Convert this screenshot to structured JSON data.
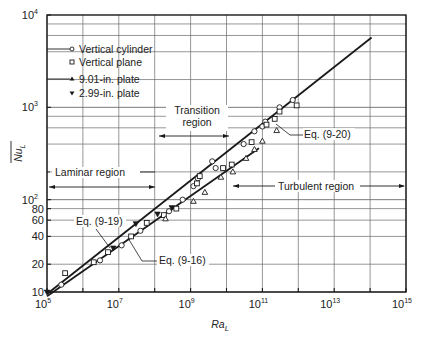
{
  "chart_data": {
    "type": "scatter",
    "title": "",
    "xlabel": "Ra_L",
    "ylabel": "Nu_L (overbar)",
    "xscale": "log",
    "yscale": "log",
    "xlim": [
      100000,
      1000000000000000.0
    ],
    "ylim": [
      10,
      10000
    ],
    "grid": true,
    "x_ticks": [
      {
        "value": 100000.0,
        "base": "10",
        "exp": "5"
      },
      {
        "value": 10000000.0,
        "base": "10",
        "exp": "7"
      },
      {
        "value": 1000000000.0,
        "base": "10",
        "exp": "9"
      },
      {
        "value": 100000000000.0,
        "base": "10",
        "exp": "11"
      },
      {
        "value": 10000000000000.0,
        "base": "10",
        "exp": "13"
      },
      {
        "value": 1000000000000000.0,
        "base": "10",
        "exp": "15"
      }
    ],
    "y_ticks": [
      {
        "value": 10,
        "label": "10",
        "exp": ""
      },
      {
        "value": 20,
        "label": "20",
        "exp": ""
      },
      {
        "value": 40,
        "label": "40",
        "exp": ""
      },
      {
        "value": 60,
        "label": "60",
        "exp": ""
      },
      {
        "value": 80,
        "label": "80",
        "exp": ""
      },
      {
        "value": 100,
        "label": "10",
        "exp": "2"
      },
      {
        "value": 1000,
        "label": "10",
        "exp": "3"
      },
      {
        "value": 10000,
        "label": "10",
        "exp": "4"
      }
    ],
    "legend": {
      "position": "upper-left",
      "entries": [
        {
          "marker": "circle",
          "label": "Vertical cylinder"
        },
        {
          "marker": "square",
          "label": "Vertical plane"
        },
        {
          "marker": "triangle-up",
          "label": "9.01-in. plate"
        },
        {
          "marker": "triangle-down",
          "label": "2.99-in. plate"
        }
      ]
    },
    "lines": [
      {
        "name": "Eq. (9-19)",
        "x": [
          100000.0,
          110000000000000.0
        ],
        "y": [
          9.5,
          5700
        ]
      },
      {
        "name": "Eq. (9-16)",
        "x": [
          100000.0,
          80000000000.0
        ],
        "y": [
          9.0,
          360
        ]
      }
    ],
    "series": [
      {
        "name": "Vertical cylinder",
        "marker": "circle",
        "points": [
          [
            250000.0,
            12
          ],
          [
            3000000.0,
            22
          ],
          [
            12000000.0,
            32
          ],
          [
            40000000.0,
            46
          ],
          [
            250000000.0,
            75
          ],
          [
            600000000.0,
            100
          ],
          [
            1600000000.0,
            170
          ],
          [
            1200000000.0,
            140
          ],
          [
            5000000000.0,
            220
          ],
          [
            4000000000.0,
            260
          ],
          [
            30000000000.0,
            400
          ],
          [
            60000000000.0,
            550
          ],
          [
            100000000000.0,
            620
          ],
          [
            120000000000.0,
            700
          ],
          [
            300000000000.0,
            1000
          ],
          [
            700000000000.0,
            1200
          ]
        ]
      },
      {
        "name": "Vertical plane",
        "marker": "square",
        "points": [
          [
            320000.0,
            16
          ],
          [
            2000000.0,
            21
          ],
          [
            5000000.0,
            27
          ],
          [
            22000000.0,
            40
          ],
          [
            60000000.0,
            56
          ],
          [
            180000000.0,
            68
          ],
          [
            400000000.0,
            80
          ],
          [
            1500000000.0,
            150
          ],
          [
            1800000000.0,
            180
          ],
          [
            8000000000.0,
            220
          ],
          [
            14000000000.0,
            240
          ],
          [
            50000000000.0,
            420
          ],
          [
            130000000000.0,
            650
          ],
          [
            220000000000.0,
            750
          ],
          [
            300000000000.0,
            900
          ],
          [
            900000000000.0,
            1050
          ]
        ]
      },
      {
        "name": "9.01-in. plate",
        "marker": "triangle-up",
        "points": [
          [
            200000000.0,
            62
          ],
          [
            1200000000.0,
            96
          ],
          [
            2500000000.0,
            120
          ],
          [
            7000000000.0,
            175
          ],
          [
            15000000000.0,
            200
          ],
          [
            35000000000.0,
            280
          ],
          [
            60000000000.0,
            350
          ],
          [
            100000000000.0,
            430
          ],
          [
            250000000000.0,
            560
          ]
        ]
      },
      {
        "name": "2.99-in. plate",
        "marker": "triangle-down",
        "points": [
          [
            100000.0,
            10
          ],
          [
            7000000.0,
            30
          ],
          [
            30000000.0,
            55
          ],
          [
            120000000.0,
            70
          ],
          [
            300000000.0,
            82
          ]
        ]
      }
    ],
    "annotations": [
      {
        "text": "Laminar region",
        "arrow_from": 100000.0,
        "arrow_to": 100000000.0,
        "y": 130
      },
      {
        "text": "Transition region",
        "arrow_from": 100000000.0,
        "arrow_to": 10000000000.0,
        "y": 470
      },
      {
        "text": "Turbulent region",
        "arrow_from": 10000000000.0,
        "arrow_to": 1000000000000000.0,
        "y": 160
      },
      {
        "text": "Eq. (9-20)"
      },
      {
        "text": "Eq. (9-19)"
      },
      {
        "text": "Eq. (9-16)"
      }
    ]
  },
  "labels": {
    "y_axis": "Nu",
    "y_axis_sub": "L",
    "x_axis": "Ra",
    "x_axis_sub": "L",
    "legend": [
      "Vertical cylinder",
      "Vertical plane",
      "9.01-in. plate",
      "2.99-in. plate"
    ],
    "laminar": "Laminar region",
    "transition_1": "Transition",
    "transition_2": "region",
    "turbulent": "Turbulent region",
    "eq_9_20": "Eq. (9-20)",
    "eq_9_19": "Eq. (9-19)",
    "eq_9_16": "Eq. (9-16)"
  },
  "colors": {
    "ink": "#1a1a1a",
    "grid": "#6a6a6a",
    "background": "#ffffff"
  }
}
